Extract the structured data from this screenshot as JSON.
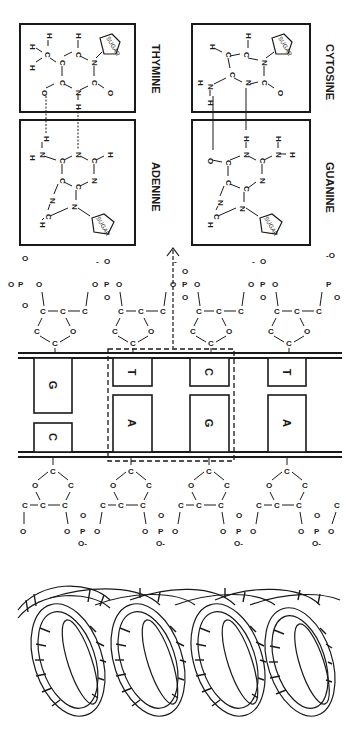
{
  "diagram": {
    "orientation": "rotated 90 degrees clockwise",
    "colors": {
      "ink": "#1a1a1a",
      "background": "#ffffff"
    },
    "base_pairs_detail": [
      {
        "left": {
          "name": "ADENINE",
          "atoms": [
            "H",
            "N",
            "H",
            "C",
            "N",
            "C",
            "H",
            "N",
            "C",
            "C",
            "N",
            "C",
            "H",
            "N",
            "SUGAR"
          ]
        },
        "right": {
          "name": "THYMINE",
          "atoms": [
            "H",
            "C",
            "H",
            "H",
            "C",
            "C",
            "H",
            "O",
            "C",
            "N",
            "H",
            "C",
            "N",
            "O",
            "SUGAR"
          ]
        },
        "hydrogen_bonds": 2
      },
      {
        "left": {
          "name": "GUANINE",
          "atoms": [
            "O",
            "C",
            "N",
            "H",
            "C",
            "N",
            "H",
            "H",
            "C",
            "N",
            "C",
            "N",
            "H",
            "SUGAR"
          ]
        },
        "right": {
          "name": "CYTOSINE",
          "atoms": [
            "H",
            "N",
            "H",
            "C",
            "H",
            "C",
            "C",
            "H",
            "N",
            "N",
            "C",
            "O",
            "SUGAR"
          ]
        },
        "hydrogen_bonds": 3
      }
    ],
    "sugar_label": "SUGAR",
    "ladder": {
      "rungs": [
        {
          "top_base": "G",
          "bottom_base": "C"
        },
        {
          "top_base": "T",
          "bottom_base": "A"
        },
        {
          "top_base": "C",
          "bottom_base": "G"
        },
        {
          "top_base": "T",
          "bottom_base": "A"
        }
      ],
      "highlighted_rungs": [
        1,
        2
      ]
    },
    "backbone_atoms": {
      "carbon": "C",
      "oxygen": "O",
      "phosphorus": "P",
      "charge": "-"
    },
    "helix": {
      "turns": 4,
      "description": "double helix ribbon"
    }
  }
}
